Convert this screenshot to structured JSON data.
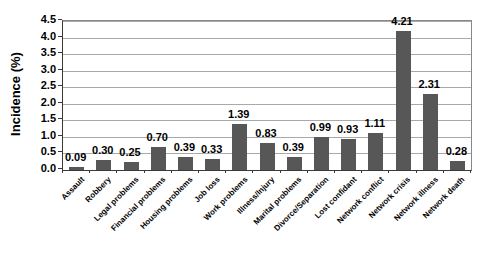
{
  "chart_data": {
    "type": "bar",
    "title": "",
    "xlabel": "",
    "ylabel": "Incidence (%)",
    "ylim": [
      0,
      4.5
    ],
    "ytick_step": 0.5,
    "ytick_labels": [
      "0.0",
      "0.5",
      "1.0",
      "1.5",
      "2.0",
      "2.5",
      "3.0",
      "3.5",
      "4.0",
      "4.5"
    ],
    "grid": true,
    "legend": false,
    "bar_color": "#575757",
    "gridline_color": "#a9a9a9",
    "categories": [
      "Assault",
      "Robbery",
      "Legal problems",
      "Financial problems",
      "Housing problems",
      "Job loss",
      "Work problems",
      "Illness/Injury",
      "Marital problems",
      "Divorce/Separation",
      "Lost confidant",
      "Network conflict",
      "Network crisis",
      "Network illness",
      "Network death"
    ],
    "values": [
      0.09,
      0.3,
      0.25,
      0.7,
      0.39,
      0.33,
      1.39,
      0.83,
      0.39,
      0.99,
      0.93,
      1.11,
      4.21,
      2.31,
      0.28
    ],
    "value_labels": [
      "0.09",
      "0.30",
      "0.25",
      "0.70",
      "0.39",
      "0.33",
      "1.39",
      "0.83",
      "0.39",
      "0.99",
      "0.93",
      "1.11",
      "4.21",
      "2.31",
      "0.28"
    ]
  }
}
